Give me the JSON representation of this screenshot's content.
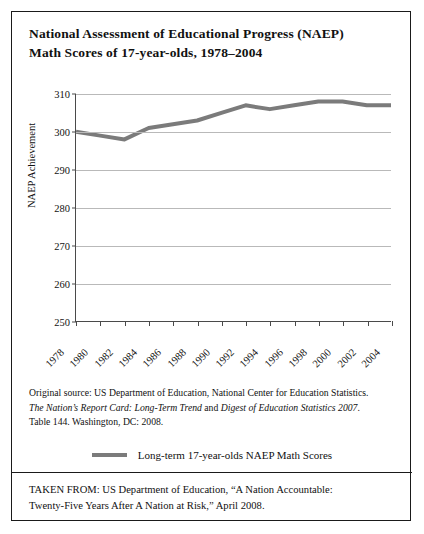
{
  "title": {
    "line1": "National Assessment of Educational Progress (NAEP)",
    "line2": "Math Scores of 17-year-olds, 1978–2004"
  },
  "chart_data": {
    "type": "line",
    "title": "National Assessment of Educational Progress (NAEP) Math Scores of 17-year-olds, 1978–2004",
    "xlabel": "",
    "ylabel": "NAEP Achievement",
    "ylim": [
      250,
      310
    ],
    "xlim": [
      1978,
      2004
    ],
    "ytick_step": 10,
    "xtick_step": 2,
    "grid": "horizontal",
    "legend_position": "bottom-center",
    "line_color": "#7b7b7b",
    "line_width": 4,
    "categories": [
      1978,
      1980,
      1982,
      1984,
      1986,
      1988,
      1990,
      1992,
      1994,
      1996,
      1998,
      2000,
      2002,
      2004
    ],
    "yticks": [
      250,
      260,
      270,
      280,
      290,
      300,
      310
    ],
    "xticks": [
      "1978",
      "1980",
      "1982",
      "1984",
      "1986",
      "1988",
      "1990",
      "1992",
      "1994",
      "1996",
      "1998",
      "2000",
      "2002",
      "2004"
    ],
    "series": [
      {
        "name": "Long-term 17-year-olds NAEP Math Scores",
        "values": [
          300,
          299,
          298,
          301,
          302,
          303,
          305,
          307,
          306,
          307,
          308,
          308,
          307,
          307
        ]
      }
    ]
  },
  "source_note": {
    "line1": "Original source: US Department of Education, National Center for Education Statistics.",
    "line2_italic_a": "The Nation’s Report Card: Long-Term Trend",
    "line2_plain": " and ",
    "line2_italic_b": "Digest of Education Statistics 2007",
    "line2_end": ".",
    "line3": "Table 144. Washington, DC: 2008."
  },
  "legend": {
    "label": "Long-term 17-year-olds NAEP Math Scores"
  },
  "taken_from": {
    "line1": "TAKEN FROM: US Department of Education, “A Nation Accountable:",
    "line2": "Twenty-Five Years After A Nation at Risk,” April 2008."
  }
}
